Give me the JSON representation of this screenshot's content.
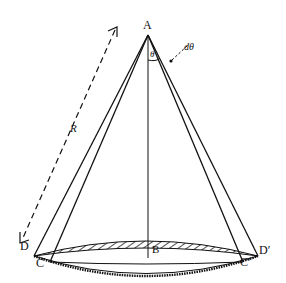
{
  "diagram": {
    "type": "geometric figure",
    "labels": {
      "apex": "A",
      "base_center": "B",
      "outer_left": "D",
      "inner_left": "C",
      "inner_right": "C′",
      "outer_right": "D′",
      "slant": "R",
      "angle": "θ",
      "angle_increment": "dθ"
    },
    "colors": {
      "line": "#111111",
      "background": "#ffffff"
    }
  }
}
